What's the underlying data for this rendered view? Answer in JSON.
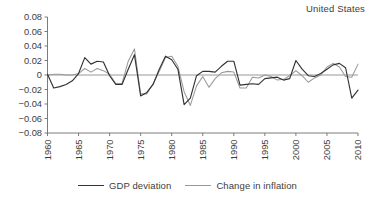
{
  "chart_data": {
    "type": "line",
    "title": "United States",
    "xlabel": "",
    "ylabel": "",
    "xlim": [
      1960,
      2010
    ],
    "ylim": [
      -0.08,
      0.08
    ],
    "grid": false,
    "legend_position": "bottom-center",
    "y_ticks": [
      "0.08",
      "0.06",
      "0.04",
      "0.02",
      "0",
      "−0.02",
      "−0.04",
      "−0.06",
      "−0.08"
    ],
    "y_tick_values": [
      0.08,
      0.06,
      0.04,
      0.02,
      0,
      -0.02,
      -0.04,
      -0.06,
      -0.08
    ],
    "x_ticks": [
      "1960",
      "1965",
      "1970",
      "1975",
      "1980",
      "1985",
      "1990",
      "1995",
      "2000",
      "2005",
      "2010"
    ],
    "x_tick_values": [
      1960,
      1965,
      1970,
      1975,
      1980,
      1985,
      1990,
      1995,
      2000,
      2005,
      2010
    ],
    "x": [
      1960,
      1961,
      1962,
      1963,
      1964,
      1965,
      1966,
      1967,
      1968,
      1969,
      1970,
      1971,
      1972,
      1973,
      1974,
      1975,
      1976,
      1977,
      1978,
      1979,
      1980,
      1981,
      1982,
      1983,
      1984,
      1985,
      1986,
      1987,
      1988,
      1989,
      1990,
      1991,
      1992,
      1993,
      1994,
      1995,
      1996,
      1997,
      1998,
      1999,
      2000,
      2001,
      2002,
      2003,
      2004,
      2005,
      2006,
      2007,
      2008,
      2009,
      2010
    ],
    "series": [
      {
        "name": "GDP deviation",
        "color": "#333333",
        "values": [
          0.001,
          -0.018,
          -0.016,
          -0.013,
          -0.008,
          0.002,
          0.024,
          0.015,
          0.019,
          0.018,
          -0.001,
          -0.013,
          -0.013,
          0.008,
          0.028,
          -0.029,
          -0.024,
          -0.013,
          0.008,
          0.026,
          0.021,
          0.008,
          -0.041,
          -0.032,
          -0.001,
          0.005,
          0.005,
          0.004,
          0.012,
          0.019,
          0.019,
          -0.014,
          -0.013,
          -0.012,
          -0.013,
          -0.005,
          -0.004,
          -0.003,
          -0.007,
          -0.005,
          0.02,
          0.008,
          -0.001,
          -0.002,
          0.002,
          0.008,
          0.014,
          0.016,
          0.01,
          -0.032,
          -0.021
        ]
      },
      {
        "name": "Change in inflation",
        "color": "#999999",
        "values": [
          0.0,
          0.001,
          0.001,
          0.0,
          0.0,
          0.002,
          0.009,
          0.004,
          0.009,
          0.006,
          0.001,
          -0.012,
          -0.012,
          0.019,
          0.036,
          -0.026,
          -0.026,
          -0.012,
          0.005,
          0.024,
          0.026,
          0.012,
          -0.023,
          -0.042,
          -0.015,
          -0.002,
          -0.017,
          -0.005,
          0.003,
          0.005,
          0.004,
          -0.018,
          -0.018,
          -0.003,
          -0.004,
          0.0,
          -0.002,
          -0.007,
          -0.006,
          -0.001,
          0.006,
          -0.001,
          -0.01,
          -0.004,
          0.0,
          0.011,
          0.016,
          0.011,
          -0.002,
          -0.003,
          0.015
        ]
      }
    ]
  },
  "legend": {
    "entries": [
      {
        "label": "GDP deviation",
        "color": "#333333"
      },
      {
        "label": "Change in inflation",
        "color": "#999999"
      }
    ]
  }
}
